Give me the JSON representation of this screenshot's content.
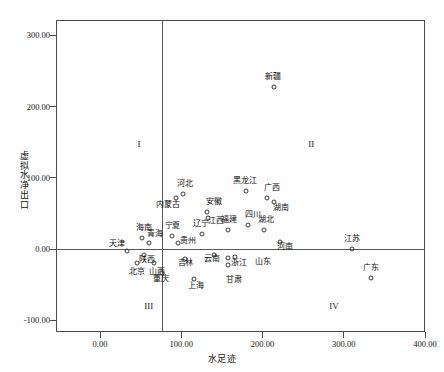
{
  "chart_data": {
    "type": "scatter",
    "title": "",
    "xlabel": "水足迹",
    "ylabel": "虚拟水净出口",
    "xlim": [
      -10,
      420
    ],
    "ylim": [
      -130,
      330
    ],
    "grid": false,
    "legend": "none",
    "x_ticks": [
      "0.00",
      "100.00",
      "200.00",
      "300.00",
      "400.00"
    ],
    "x_tick_values": [
      0,
      100,
      200,
      300,
      400
    ],
    "y_ticks": [
      "-100.00",
      "0.00",
      "100.00",
      "200.00",
      "300.00"
    ],
    "y_tick_values": [
      -100,
      0,
      100,
      200,
      300
    ],
    "reference_lines": {
      "vertical_x": 100,
      "horizontal_y": 0
    },
    "quadrant_labels": [
      {
        "label": "I",
        "x": 48,
        "y": 148
      },
      {
        "label": "II",
        "x": 260,
        "y": 148
      },
      {
        "label": "III",
        "x": 60,
        "y": -80
      },
      {
        "label": "IV",
        "x": 288,
        "y": -80
      }
    ],
    "points": [
      {
        "name": "新疆",
        "x": 214,
        "y": 228,
        "label_dx": -1,
        "label_dy": -6
      },
      {
        "name": "黑龙江",
        "x": 180,
        "y": 82,
        "label_dx": -1,
        "label_dy": -6
      },
      {
        "name": "广西",
        "x": 205,
        "y": 72,
        "label_dx": 5,
        "label_dy": -6
      },
      {
        "name": "湖南",
        "x": 214,
        "y": 66,
        "label_dx": 7,
        "label_dy": 10
      },
      {
        "name": "河北",
        "x": 102,
        "y": 77,
        "label_dx": 2,
        "label_dy": -6
      },
      {
        "name": "内蒙古",
        "x": 93,
        "y": 71,
        "label_dx": -8,
        "label_dy": 11
      },
      {
        "name": "安徽",
        "x": 132,
        "y": 52,
        "label_dx": 7,
        "label_dy": -6
      },
      {
        "name": "江西",
        "x": 133,
        "y": 44,
        "label_dx": 8,
        "label_dy": 7
      },
      {
        "name": "四川",
        "x": 182,
        "y": 33,
        "label_dx": 5,
        "label_dy": -6
      },
      {
        "name": "湖北",
        "x": 202,
        "y": 27,
        "label_dx": 2,
        "label_dy": -6
      },
      {
        "name": "福建",
        "x": 158,
        "y": 27,
        "label_dx": 1,
        "label_dy": -6
      },
      {
        "name": "辽宁",
        "x": 125,
        "y": 21,
        "label_dx": -1,
        "label_dy": -6
      },
      {
        "name": "宁夏",
        "x": 88,
        "y": 18,
        "label_dx": 1,
        "label_dy": -6
      },
      {
        "name": "海南",
        "x": 52,
        "y": 16,
        "label_dx": 2,
        "label_dy": -6
      },
      {
        "name": "青海",
        "x": 60,
        "y": 8,
        "label_dx": 6,
        "label_dy": -5
      },
      {
        "name": "贵州",
        "x": 96,
        "y": 8,
        "label_dx": 10,
        "label_dy": 2
      },
      {
        "name": "河南",
        "x": 222,
        "y": 10,
        "label_dx": 5,
        "label_dy": 9
      },
      {
        "name": "天津",
        "x": 33,
        "y": -3,
        "label_dx": -10,
        "label_dy": -3
      },
      {
        "name": "陕西",
        "x": 54,
        "y": -8,
        "label_dx": 3,
        "label_dy": 9
      },
      {
        "name": "云南",
        "x": 140,
        "y": -9,
        "label_dx": -2,
        "label_dy": 8
      },
      {
        "name": "浙江",
        "x": 158,
        "y": -12,
        "label_dx": 11,
        "label_dy": 9
      },
      {
        "name": "山东",
        "x": 166,
        "y": -11,
        "label_dx": 28,
        "label_dy": 9
      },
      {
        "name": "吉林",
        "x": 104,
        "y": -14,
        "label_dx": 1,
        "label_dy": 8
      },
      {
        "name": "北京",
        "x": 45,
        "y": -19,
        "label_dx": 0,
        "label_dy": 13
      },
      {
        "name": "山西",
        "x": 66,
        "y": -20,
        "label_dx": 3,
        "label_dy": 13
      },
      {
        "name": "甘肃",
        "x": 157,
        "y": -22,
        "label_dx": 6,
        "label_dy": 19
      },
      {
        "name": "重庆",
        "x": 76,
        "y": -33,
        "label_dx": -1,
        "label_dy": 10
      },
      {
        "name": "上海",
        "x": 116,
        "y": -42,
        "label_dx": 2,
        "label_dy": 11
      },
      {
        "name": "江苏",
        "x": 310,
        "y": 0,
        "label_dx": 0,
        "label_dy": -6
      },
      {
        "name": "广东",
        "x": 333,
        "y": -40,
        "label_dx": 0,
        "label_dy": -6
      }
    ]
  },
  "axis": {
    "x_title": "水足迹",
    "y_title": "虚拟水净出口"
  }
}
